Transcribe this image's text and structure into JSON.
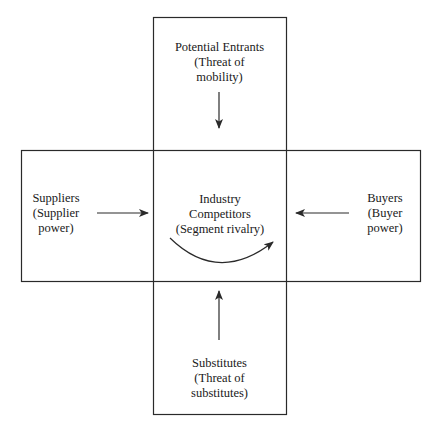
{
  "diagram": {
    "nodes": {
      "top": {
        "lines": [
          "Potential Entrants",
          "(Threat of",
          "mobility)"
        ]
      },
      "left": {
        "lines": [
          "Suppliers",
          "(Supplier",
          "power)"
        ]
      },
      "center": {
        "lines": [
          "Industry",
          "Competitors",
          "(Segment rivalry)"
        ]
      },
      "right": {
        "lines": [
          "Buyers",
          "(Buyer",
          "power)"
        ]
      },
      "bottom": {
        "lines": [
          "Substitutes",
          "(Threat of",
          "substitutes)"
        ]
      }
    },
    "edges": [
      {
        "from": "top",
        "to": "center"
      },
      {
        "from": "left",
        "to": "center"
      },
      {
        "from": "right",
        "to": "center"
      },
      {
        "from": "bottom",
        "to": "center"
      },
      {
        "from": "center",
        "to": "center",
        "style": "curved"
      }
    ],
    "colors": {
      "line": "#2a2a2a",
      "text": "#1a1a1a",
      "background": "#ffffff"
    }
  }
}
